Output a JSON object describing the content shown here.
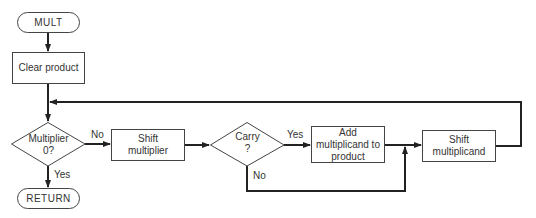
{
  "diagram": {
    "type": "flowchart",
    "nodes": {
      "start": {
        "label": "MULT",
        "shape": "terminal"
      },
      "clear": {
        "label": "Clear product",
        "shape": "process"
      },
      "test_multiplier": {
        "line1": "Multiplier",
        "line2": "0?",
        "shape": "decision"
      },
      "shift_multiplier": {
        "line1": "Shift",
        "line2": "multiplier",
        "shape": "process"
      },
      "carry": {
        "line1": "Carry",
        "line2": "?",
        "shape": "decision"
      },
      "add": {
        "line1": "Add",
        "line2": "multiplicand to",
        "line3": "product",
        "shape": "process"
      },
      "shift_multiplicand": {
        "line1": "Shift",
        "line2": "multiplicand",
        "shape": "process"
      },
      "end": {
        "label": "RETURN",
        "shape": "terminal"
      }
    },
    "edge_labels": {
      "multiplier_no": "No",
      "multiplier_yes": "Yes",
      "carry_yes": "Yes",
      "carry_no": "No"
    },
    "edges": [
      {
        "from": "start",
        "to": "clear"
      },
      {
        "from": "clear",
        "to": "test_multiplier"
      },
      {
        "from": "test_multiplier",
        "to": "shift_multiplier",
        "label": "No"
      },
      {
        "from": "test_multiplier",
        "to": "end",
        "label": "Yes"
      },
      {
        "from": "shift_multiplier",
        "to": "carry"
      },
      {
        "from": "carry",
        "to": "add",
        "label": "Yes"
      },
      {
        "from": "carry",
        "to": "shift_multiplicand",
        "label": "No"
      },
      {
        "from": "add",
        "to": "shift_multiplicand"
      },
      {
        "from": "shift_multiplicand",
        "to": "test_multiplier"
      }
    ]
  }
}
